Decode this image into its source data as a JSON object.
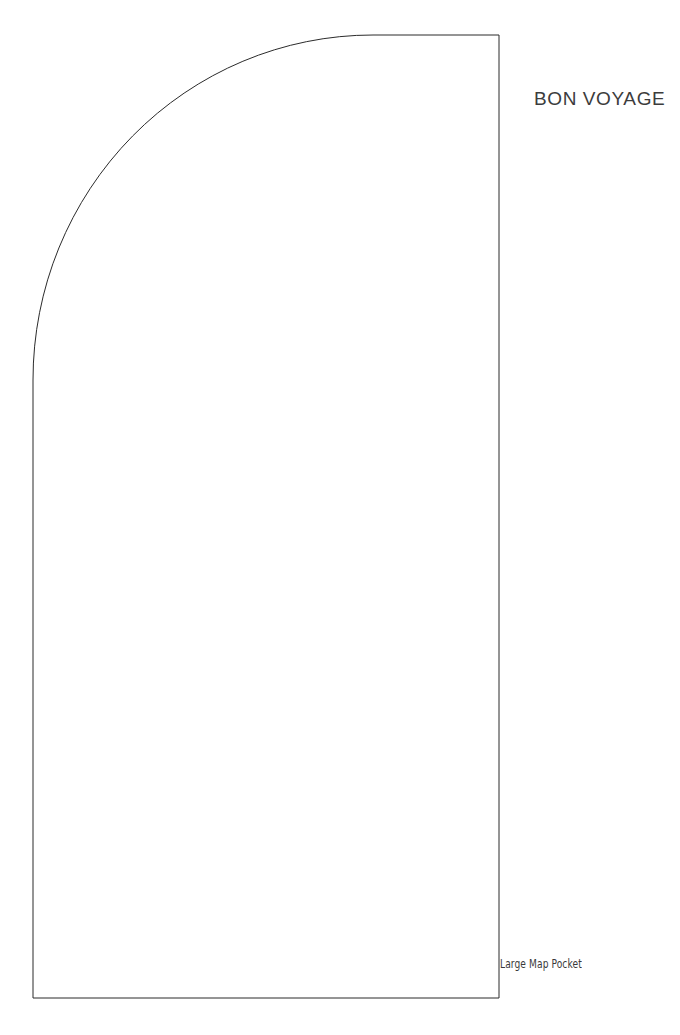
{
  "document": {
    "kind": "sewing-pattern-template",
    "background_color": "#ffffff",
    "width": 680,
    "height": 1035
  },
  "title": {
    "text": "BON VOYAGE",
    "color": "#3c3c3c",
    "font_size_px": 19,
    "x": 534,
    "y": 88
  },
  "piece": {
    "label": "Large Map Pocket",
    "label_color": "#3a3a3a",
    "label_font_size_px": 11.5,
    "label_x": 500,
    "label_y": 957,
    "outline_color": "#2b2b2b",
    "outline_width_px": 1,
    "fill_color": "#ffffff",
    "geometry": {
      "description": "Rectangle with top-left corner replaced by a large elliptical arc",
      "left_x": 33,
      "right_x": 499,
      "top_y": 35,
      "bottom_y": 998,
      "arc_start_x": 373,
      "arc_start_y": 35,
      "arc_end_x": 33,
      "arc_end_y": 380,
      "arc_radius_x": 340,
      "arc_radius_y": 345,
      "path": "M 499 35 L 373 35 A 340 345 0 0 0 33 380 L 33 998 L 499 998 Z"
    }
  }
}
